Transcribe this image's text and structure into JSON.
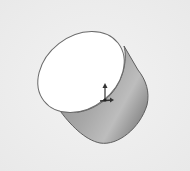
{
  "scene": {
    "label": "3D cylinder model",
    "object": "cylinder",
    "background_color": "#eeeeee",
    "top_face_color": "#ffffff",
    "side_color_light": "#a9a9a9",
    "side_color_dark": "#7c7c7c",
    "edge_color": "#5a5a5a",
    "triad": "coordinate-axis-triad"
  }
}
